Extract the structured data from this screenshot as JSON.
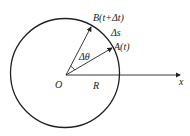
{
  "diagram": {
    "labels": {
      "B": "B(t+Δt)",
      "delta_s": "Δs",
      "A": "A(t)",
      "delta_theta": "Δθ",
      "O": "O",
      "R": "R",
      "x": "x"
    },
    "colors": {
      "stroke": "#222222",
      "background": "#ffffff"
    }
  }
}
